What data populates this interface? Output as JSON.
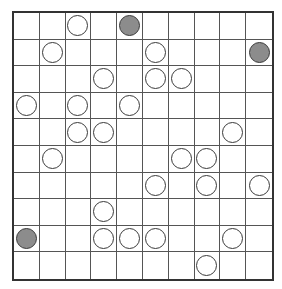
{
  "puzzle": {
    "type": "masyu",
    "rows": 10,
    "cols": 10,
    "colors": {
      "white_circle": "#ffffff",
      "black_circle": "#8c8c8c",
      "grid_line": "#555555",
      "border": "#333333"
    },
    "circles": [
      {
        "row": 0,
        "col": 2,
        "color": "white"
      },
      {
        "row": 0,
        "col": 4,
        "color": "black"
      },
      {
        "row": 1,
        "col": 1,
        "color": "white"
      },
      {
        "row": 1,
        "col": 5,
        "color": "white"
      },
      {
        "row": 1,
        "col": 9,
        "color": "black"
      },
      {
        "row": 2,
        "col": 3,
        "color": "white"
      },
      {
        "row": 2,
        "col": 5,
        "color": "white"
      },
      {
        "row": 2,
        "col": 6,
        "color": "white"
      },
      {
        "row": 3,
        "col": 0,
        "color": "white"
      },
      {
        "row": 3,
        "col": 2,
        "color": "white"
      },
      {
        "row": 3,
        "col": 4,
        "color": "white"
      },
      {
        "row": 4,
        "col": 2,
        "color": "white"
      },
      {
        "row": 4,
        "col": 3,
        "color": "white"
      },
      {
        "row": 4,
        "col": 8,
        "color": "white"
      },
      {
        "row": 5,
        "col": 1,
        "color": "white"
      },
      {
        "row": 5,
        "col": 6,
        "color": "white"
      },
      {
        "row": 5,
        "col": 7,
        "color": "white"
      },
      {
        "row": 6,
        "col": 5,
        "color": "white"
      },
      {
        "row": 6,
        "col": 7,
        "color": "white"
      },
      {
        "row": 6,
        "col": 9,
        "color": "white"
      },
      {
        "row": 7,
        "col": 3,
        "color": "white"
      },
      {
        "row": 8,
        "col": 0,
        "color": "black"
      },
      {
        "row": 8,
        "col": 3,
        "color": "white"
      },
      {
        "row": 8,
        "col": 4,
        "color": "white"
      },
      {
        "row": 8,
        "col": 5,
        "color": "white"
      },
      {
        "row": 8,
        "col": 8,
        "color": "white"
      },
      {
        "row": 9,
        "col": 7,
        "color": "white"
      }
    ]
  }
}
